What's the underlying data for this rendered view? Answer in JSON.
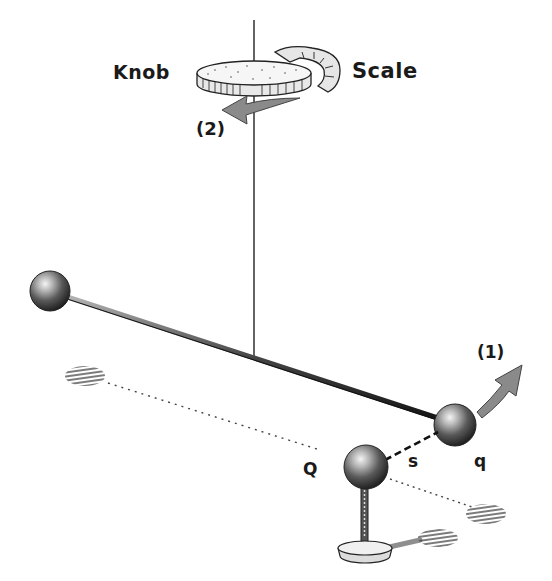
{
  "diagram": {
    "type": "physics-illustration",
    "labels": {
      "knob": "Knob",
      "scale": "Scale",
      "arrow_2": "(2)",
      "arrow_1": "(1)",
      "charge_Q": "Q",
      "separation_s": "s",
      "charge_q": "q"
    },
    "colors": {
      "ink": "#1a1a1a",
      "sphere_dark": "#2b2b2b",
      "sphere_mid": "#7a7a7a",
      "sphere_highlight": "#f2f2f2",
      "arrow_fill": "#8a8a8a",
      "background": "#ffffff"
    }
  }
}
